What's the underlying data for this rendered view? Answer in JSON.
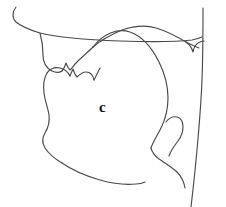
{
  "diagram": {
    "type": "sagittal-section",
    "background_color": "#ffffff",
    "line_color": "#4a4a4a",
    "label_color": "#111111",
    "width": 226,
    "height": 207,
    "labels": [
      {
        "id": "place-c",
        "text": "c",
        "x": 99,
        "y": 101,
        "font_size": 15,
        "bold": true,
        "region": "oral-cavity"
      }
    ],
    "structures": [
      {
        "name": "upper-lip",
        "description": "upper lip outline with nostril curl at top left"
      },
      {
        "name": "upper-teeth-alveolar-ridge",
        "description": "upper teeth and alveolar ridge notch"
      },
      {
        "name": "hard-palate",
        "description": "hard palate roof of mouth"
      },
      {
        "name": "velum-uvula",
        "description": "soft palate with uvula hanging at right"
      },
      {
        "name": "nasal-floor",
        "description": "floor of nasal cavity running to the back wall"
      },
      {
        "name": "tongue",
        "description": "tongue body, dorsum and root"
      },
      {
        "name": "lower-lip",
        "description": "lower lip outline"
      },
      {
        "name": "lower-teeth",
        "description": "lower teeth notch"
      },
      {
        "name": "jaw-floor",
        "description": "floor of the mouth and jaw underside"
      },
      {
        "name": "pharyngeal-wall",
        "description": "posterior pharyngeal wall at right edge"
      },
      {
        "name": "epiglottis",
        "description": "epiglottis hook in lower pharynx"
      }
    ]
  }
}
